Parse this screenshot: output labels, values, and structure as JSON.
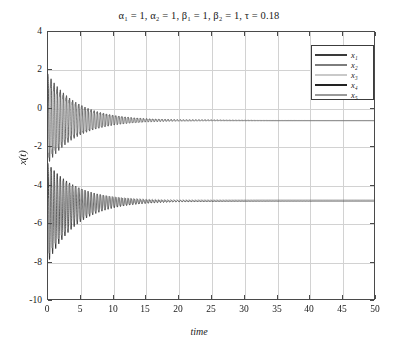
{
  "figure": {
    "title": "α₁ = 1, α₂ = 1, β₁ = 1, β₂ = 1, τ = 0.18",
    "xlabel": "time",
    "ylabel": "x(t)"
  },
  "axes": {
    "xticks": [
      "0",
      "5",
      "10",
      "15",
      "20",
      "25",
      "30",
      "35",
      "40",
      "45",
      "50"
    ],
    "yticks": [
      "4",
      "2",
      "0",
      "-2",
      "-4",
      "-6",
      "-8",
      "-10"
    ]
  },
  "legend": {
    "items": [
      {
        "label": "x₁",
        "color": "#3a3a3a"
      },
      {
        "label": "x₂",
        "color": "#7d7d7d"
      },
      {
        "label": "x₃",
        "color": "#c9c9c9"
      },
      {
        "label": "x₄",
        "color": "#222222"
      },
      {
        "label": "x₅",
        "color": "#9a9a9a"
      }
    ]
  },
  "chart_data": {
    "type": "line",
    "title": "α₁ = 1, α₂ = 1, β₁ = 1, β₂ = 1, τ = 0.18",
    "xlabel": "time",
    "ylabel": "x(t)",
    "xlim": [
      0,
      50
    ],
    "ylim": [
      -10,
      4
    ],
    "xticks": [
      0,
      5,
      10,
      15,
      20,
      25,
      30,
      35,
      40,
      45,
      50
    ],
    "yticks": [
      4,
      2,
      0,
      -2,
      -4,
      -6,
      -8,
      -10
    ],
    "grid": true,
    "legend_position": "upper right",
    "annotations": [
      {
        "text": "α₁ = 1",
        "kind": "parameter",
        "value": 1
      },
      {
        "text": "α₂ = 1",
        "kind": "parameter",
        "value": 1
      },
      {
        "text": "β₁ = 1",
        "kind": "parameter",
        "value": 1
      },
      {
        "text": "β₂ = 1",
        "kind": "parameter",
        "value": 1
      },
      {
        "text": "τ = 0.18",
        "kind": "parameter",
        "value": 0.18
      }
    ],
    "oscillation": {
      "period": 0.47,
      "decay_rate": 0.22,
      "settling_time": 25
    },
    "series": [
      {
        "name": "x₁",
        "color": "#3a3a3a",
        "group": "upper",
        "steady_state": -0.6,
        "x0": 1.8,
        "envelope_upper_start": 1.8,
        "envelope_lower_start": -2.85,
        "phase": 0.0,
        "amplitude": 2.3
      },
      {
        "name": "x₂",
        "color": "#7d7d7d",
        "group": "upper",
        "steady_state": -0.6,
        "x0": 1.55,
        "envelope_upper_start": 1.55,
        "envelope_lower_start": -2.6,
        "phase": 0.35,
        "amplitude": 2.1
      },
      {
        "name": "x₃",
        "color": "#c9c9c9",
        "group": "upper",
        "steady_state": -0.62,
        "x0": 1.2,
        "envelope_upper_start": 1.2,
        "envelope_lower_start": -2.3,
        "phase": 0.7,
        "amplitude": 1.8
      },
      {
        "name": "x₄",
        "color": "#222222",
        "group": "lower",
        "steady_state": -4.8,
        "x0": -8.0,
        "envelope_upper_start": -2.85,
        "envelope_lower_start": -8.0,
        "phase": 0.0,
        "amplitude": 2.6
      },
      {
        "name": "x₅",
        "color": "#9a9a9a",
        "group": "lower",
        "steady_state": -4.75,
        "x0": -7.6,
        "envelope_upper_start": -3.1,
        "envelope_lower_start": -7.6,
        "phase": 0.4,
        "amplitude": 2.35
      }
    ]
  }
}
